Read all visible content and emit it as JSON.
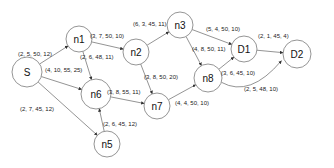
{
  "diagram": {
    "type": "directed-network",
    "nodes": [
      {
        "id": "S",
        "label": "S",
        "x": 27,
        "y": 72,
        "r": 15
      },
      {
        "id": "n1",
        "label": "n1",
        "x": 79,
        "y": 39,
        "r": 13
      },
      {
        "id": "n2",
        "label": "n2",
        "x": 136,
        "y": 52,
        "r": 13
      },
      {
        "id": "n3",
        "label": "n3",
        "x": 180,
        "y": 25,
        "r": 13
      },
      {
        "id": "D1",
        "label": "D1",
        "x": 244,
        "y": 49,
        "r": 13
      },
      {
        "id": "D2",
        "label": "D2",
        "x": 297,
        "y": 54,
        "r": 14
      },
      {
        "id": "n8",
        "label": "n8",
        "x": 208,
        "y": 78,
        "r": 14
      },
      {
        "id": "n7",
        "label": "n7",
        "x": 157,
        "y": 106,
        "r": 13
      },
      {
        "id": "n6",
        "label": "n6",
        "x": 96,
        "y": 94,
        "r": 15
      },
      {
        "id": "n5",
        "label": "n5",
        "x": 107,
        "y": 144,
        "r": 13
      }
    ],
    "edges": [
      {
        "from": "S",
        "to": "n1",
        "label": "(2, 5, 50, 12)",
        "lx": 18,
        "ly": 56
      },
      {
        "from": "S",
        "to": "n6",
        "label": "(4, 10, 55, 25)",
        "lx": 45,
        "ly": 72
      },
      {
        "from": "S",
        "to": "n5",
        "label": "(2, 7, 45, 12)",
        "lx": 20,
        "ly": 111
      },
      {
        "from": "n1",
        "to": "n2",
        "label": "(3, 7, 50, 10)",
        "lx": 90,
        "ly": 38
      },
      {
        "from": "n1",
        "to": "n6",
        "label": "(2, 6, 48, 11)",
        "lx": 80,
        "ly": 59
      },
      {
        "from": "n2",
        "to": "n3",
        "label": "(6, 3, 45, 11)",
        "lx": 133,
        "ly": 26
      },
      {
        "from": "n2",
        "to": "n7",
        "label": "(3, 8, 50, 20)",
        "lx": 144,
        "ly": 79
      },
      {
        "from": "n3",
        "to": "D1",
        "label": "(5, 4, 50, 10)",
        "lx": 206,
        "ly": 31
      },
      {
        "from": "n3",
        "to": "n8",
        "label": "(4, 8, 50, 11)",
        "lx": 192,
        "ly": 51
      },
      {
        "from": "n8",
        "to": "D1",
        "label": "(3, 6, 45, 10)",
        "lx": 221,
        "ly": 75
      },
      {
        "from": "n8",
        "to": "D2",
        "label": "(2, 5, 48, 10)",
        "lx": 244,
        "ly": 91
      },
      {
        "from": "D1",
        "to": "D2",
        "label": "(2, 1, 45, 4)",
        "lx": 258,
        "ly": 38
      },
      {
        "from": "n6",
        "to": "n7",
        "label": "(3, 8, 55, 11)",
        "lx": 107,
        "ly": 94
      },
      {
        "from": "n7",
        "to": "n8",
        "label": "(4, 4, 50, 10)",
        "lx": 175,
        "ly": 105
      },
      {
        "from": "n5",
        "to": "n6",
        "label": "(2, 6, 45, 12)",
        "lx": 103,
        "ly": 126
      }
    ]
  }
}
